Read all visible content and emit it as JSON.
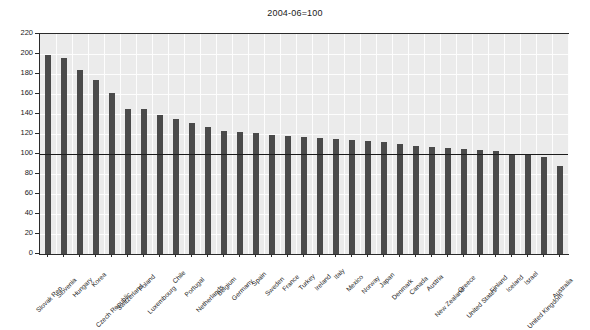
{
  "chart_data": {
    "type": "bar",
    "title": "2004-06=100",
    "subtitle": "",
    "xlabel": "",
    "ylabel": "",
    "ylim": [
      0,
      220
    ],
    "ytick_step": 20,
    "yticks": [
      0,
      20,
      40,
      60,
      80,
      100,
      120,
      140,
      160,
      180,
      200,
      220
    ],
    "grid": true,
    "legend": "none",
    "reference_line": 100,
    "bar_color": "#4a4a4a",
    "plot_background": "#ebebeb",
    "axis_color": "#2b2b2b",
    "categories": [
      "Slovak Rep.",
      "Slovenia",
      "Hungary",
      "Korea",
      "Czech Republic",
      "Switzerland",
      "Poland",
      "Luxembourg",
      "Chile",
      "Portugal",
      "Netherlands",
      "Belgium",
      "Germany",
      "Spain",
      "Sweden",
      "France",
      "Turkey",
      "Ireland",
      "Italy",
      "Mexico",
      "Norway",
      "Japan",
      "Denmark",
      "Canada",
      "Austria",
      "New Zealand",
      "Greece",
      "United States",
      "Finland",
      "Iceland",
      "Israel",
      "United Kingdom",
      "Australia"
    ],
    "values": [
      199,
      196,
      184,
      174,
      161,
      145,
      145,
      139,
      135,
      131,
      127,
      123,
      122,
      121,
      119,
      118,
      117,
      116,
      115,
      114,
      113,
      112,
      110,
      108,
      107,
      106,
      105,
      104,
      103,
      100,
      99,
      97,
      88
    ]
  }
}
